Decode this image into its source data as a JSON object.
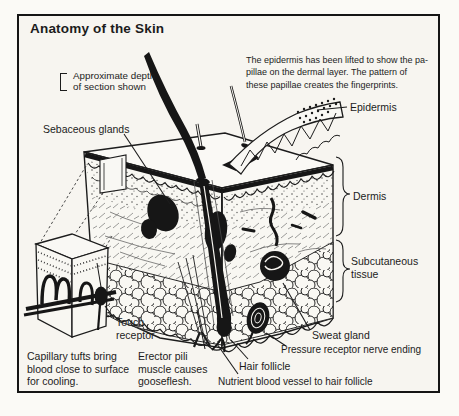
{
  "figure": {
    "title": "Anatomy of the Skin",
    "intro": "The epidermis has been lifted to show the pa-\npillae on the dermal layer. The pattern of\nthese papillae creates the fingerprints."
  },
  "labels": {
    "approx_depth": "Approximate depth\nof section shown",
    "sebaceous_glands": "Sebaceous glands",
    "epidermis": "Epidermis",
    "dermis": "Dermis",
    "subcutaneous_tissue": "Subcutaneous\ntissue",
    "touch_receptor": "Touch\nreceptor",
    "capillary_tufts": "Capillary tufts bring\nblood close to surface\nfor cooling.",
    "erector_pili": "Erector pili\nmuscle causes\ngooseflesh.",
    "hair_follicle": "Hair follicle",
    "nutrient_vessel": "Nutrient blood vessel to hair follicle",
    "pressure_receptor": "Pressure receptor nerve ending",
    "sweat_gland": "Sweat gland"
  },
  "colors": {
    "ink": "#1c1c1c",
    "paper": "#f7f5f0"
  }
}
